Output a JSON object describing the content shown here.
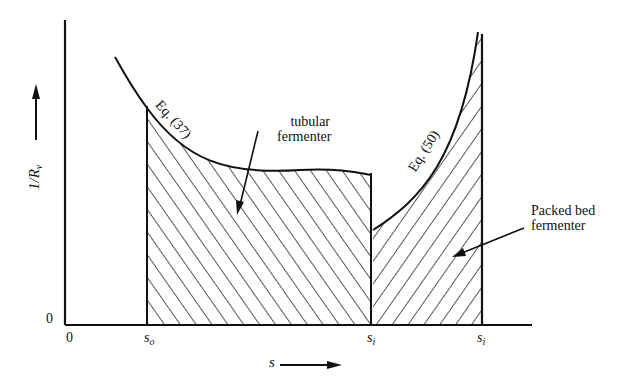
{
  "diagram": {
    "y_axis": {
      "label_main": "1/R",
      "label_sub": "v",
      "origin": "0"
    },
    "x_axis": {
      "label": "s",
      "origin": "0"
    },
    "ticks": [
      {
        "main": "s",
        "sub": "o"
      },
      {
        "main": "s",
        "sub": "i"
      },
      {
        "main": "s",
        "sub": "i"
      }
    ],
    "curves": [
      {
        "label": "Eq. (37)"
      },
      {
        "label": "Eq. (50)"
      }
    ],
    "regions": [
      {
        "label_line1": "tubular",
        "label_line2": "fermenter"
      },
      {
        "label_line1": "Packed bed",
        "label_line2": "fermenter"
      }
    ],
    "colors": {
      "ink": "#111111",
      "background": "#ffffff"
    }
  }
}
